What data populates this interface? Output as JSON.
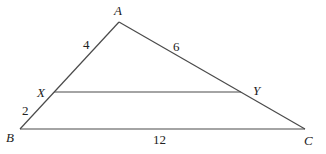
{
  "diagram": {
    "type": "triangle-with-parallel-segment",
    "colors": {
      "line": "#4a4a4a",
      "text": "#222222",
      "background": "#ffffff"
    },
    "vertices": {
      "A": {
        "label": "A",
        "x": 119,
        "y": 22
      },
      "B": {
        "label": "B",
        "x": 20,
        "y": 129
      },
      "C": {
        "label": "C",
        "x": 305,
        "y": 129
      },
      "X": {
        "label": "X",
        "x": 54,
        "y": 92
      },
      "Y": {
        "label": "Y",
        "x": 241,
        "y": 92
      }
    },
    "segments": [
      {
        "from": "A",
        "to": "B"
      },
      {
        "from": "A",
        "to": "C"
      },
      {
        "from": "B",
        "to": "C"
      },
      {
        "from": "X",
        "to": "Y"
      }
    ],
    "measurements": {
      "AX": "4",
      "AY": "6",
      "XB": "2",
      "BC": "12"
    }
  }
}
